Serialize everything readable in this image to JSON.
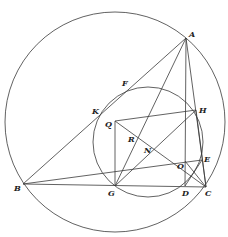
{
  "diagram": {
    "type": "geometry-figure",
    "colors": {
      "stroke": "#3a3a3a",
      "label": "#222222"
    },
    "circles": [
      {
        "name": "circumcircle",
        "cx": 115,
        "cy": 122,
        "r": 110
      },
      {
        "name": "nine-point-circle",
        "cx": 148,
        "cy": 142,
        "r": 55
      }
    ],
    "points": {
      "A": [
        186,
        38
      ],
      "B": [
        23,
        184
      ],
      "C": [
        206,
        187
      ],
      "D": [
        185,
        186
      ],
      "E": [
        202,
        160
      ],
      "F": [
        131,
        87
      ],
      "G": [
        115,
        186
      ],
      "H": [
        196,
        110
      ],
      "K": [
        103,
        112
      ],
      "N": [
        148,
        146
      ],
      "O": [
        185,
        161
      ],
      "Q": [
        115,
        121
      ],
      "R": [
        132,
        133
      ]
    },
    "segments": [
      [
        "A",
        "B"
      ],
      [
        "A",
        "C"
      ],
      [
        "A",
        "D"
      ],
      [
        "A",
        "G"
      ],
      [
        "B",
        "C"
      ],
      [
        "B",
        "E"
      ],
      [
        "G",
        "H"
      ],
      [
        "Q",
        "H"
      ],
      [
        "Q",
        "G"
      ],
      [
        "Q",
        "C"
      ],
      [
        "D",
        "E"
      ],
      [
        "O",
        "C"
      ],
      [
        "H",
        "C"
      ]
    ],
    "labels": [
      {
        "text": "A",
        "x": 189,
        "y": 30
      },
      {
        "text": "B",
        "x": 14,
        "y": 184
      },
      {
        "text": "C",
        "x": 205,
        "y": 189
      },
      {
        "text": "D",
        "x": 182,
        "y": 189
      },
      {
        "text": "E",
        "x": 204,
        "y": 155
      },
      {
        "text": "F",
        "x": 122,
        "y": 79
      },
      {
        "text": "G",
        "x": 108,
        "y": 189
      },
      {
        "text": "H",
        "x": 199,
        "y": 106
      },
      {
        "text": "K",
        "x": 92,
        "y": 107
      },
      {
        "text": "N",
        "x": 144,
        "y": 146
      },
      {
        "text": "O",
        "x": 177,
        "y": 162
      },
      {
        "text": "Q",
        "x": 105,
        "y": 120
      },
      {
        "text": "R",
        "x": 128,
        "y": 135
      }
    ]
  }
}
